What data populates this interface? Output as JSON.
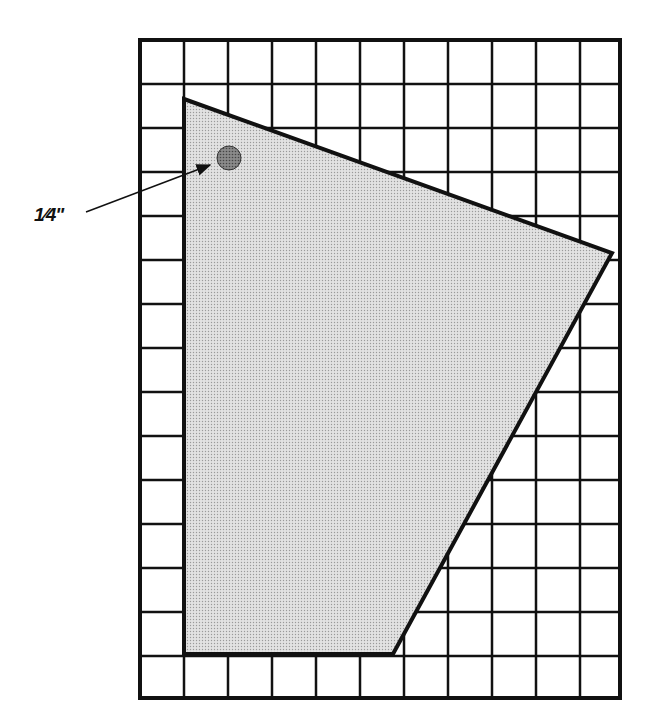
{
  "diagram": {
    "type": "grid-template-with-shaded-polygon",
    "grid": {
      "left": 140,
      "top": 40,
      "right": 620,
      "bottom": 698,
      "cell_size": 44,
      "columns_full": 10,
      "rows": 15,
      "line_color": "#111111"
    },
    "polygon": {
      "vertices": [
        [
          184,
          99
        ],
        [
          612,
          253
        ],
        [
          393,
          654
        ],
        [
          184,
          654
        ]
      ],
      "fill": "#d4d4d4",
      "stroke": "#111111"
    },
    "hole_marker": {
      "cx": 229,
      "cy": 158,
      "r": 12,
      "fill": "#7a7a7a"
    },
    "annotation": {
      "label": "1⁄4\"",
      "arrow_from": [
        86,
        212
      ],
      "arrow_to": [
        210,
        165
      ]
    }
  }
}
